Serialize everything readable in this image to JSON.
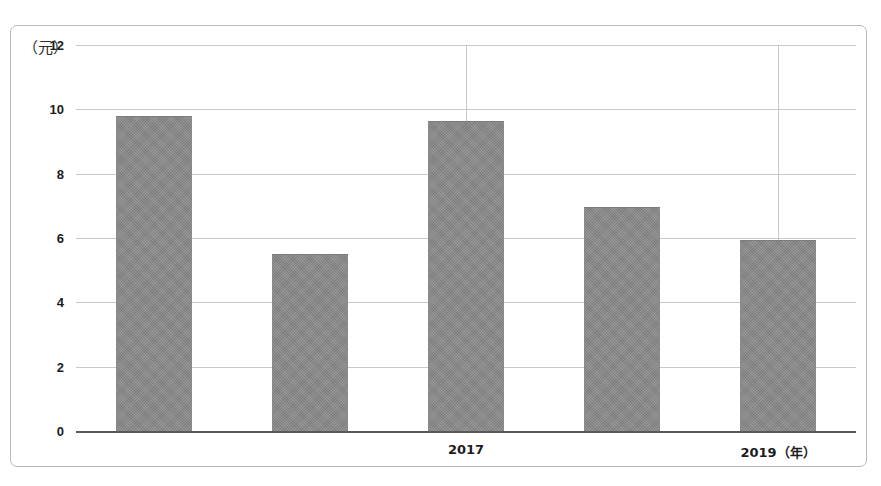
{
  "chart_data": {
    "type": "bar",
    "title": "",
    "subtitle": "",
    "xlabel": "（年）",
    "ylabel": "（元）",
    "ylim": [
      0,
      12
    ],
    "xlim": [
      2015,
      2019
    ],
    "grid": "horizontal-and-partial-vertical",
    "legend": "none",
    "y_unit_caption": "（元）",
    "y_ticks": [
      12,
      10,
      8,
      6,
      4,
      2,
      0
    ],
    "y_tick_labels": [
      "12",
      "10",
      "8",
      "6",
      "4",
      "2",
      "0"
    ],
    "categories": [
      "2015",
      "2016",
      "2017",
      "2018",
      "2019"
    ],
    "x_tick_labels_visible": [
      "2017",
      "2019（年）"
    ],
    "x_visible_label_categories": [
      "2017",
      "2019"
    ],
    "values": [
      9.8,
      5.5,
      9.65,
      6.95,
      5.95
    ],
    "series": [
      {
        "name": "value",
        "values": [
          9.8,
          5.5,
          9.65,
          6.95,
          5.95
        ]
      }
    ],
    "bar_color": "#8b8b8b",
    "gridline_color": "#c9c9c9",
    "axis_color": "#5a5a5a",
    "vertical_gridline_categories": [
      "2017",
      "2019"
    ],
    "annotations": []
  },
  "axis": {
    "y_unit": "（元）",
    "ticks_y": [
      {
        "label": "12",
        "value": 12
      },
      {
        "label": "10",
        "value": 10
      },
      {
        "label": "8",
        "value": 8
      },
      {
        "label": "6",
        "value": 6
      },
      {
        "label": "4",
        "value": 4
      },
      {
        "label": "2",
        "value": 2
      },
      {
        "label": "0",
        "value": 0
      }
    ],
    "ticks_x": [
      {
        "label": "2017",
        "value": 2017
      },
      {
        "label": "2019（年）",
        "value": 2019
      }
    ]
  }
}
